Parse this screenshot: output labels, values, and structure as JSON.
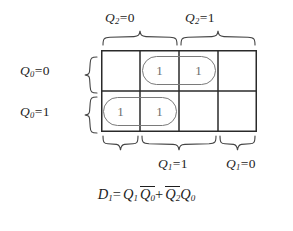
{
  "figure": {
    "name": "karnaugh-map-d1"
  },
  "colors": {
    "ink": "#1d1d1d",
    "grid_line": "#2a2a2a",
    "one_digit": "#6d6d6d",
    "group_outline": "#7a7a7a",
    "background": "#ffffff"
  },
  "column_labels": {
    "top_left": {
      "var": "Q",
      "sub": "2",
      "eq": "=",
      "value": "0",
      "spans_columns": [
        1,
        2
      ]
    },
    "top_right": {
      "var": "Q",
      "sub": "2",
      "eq": "=",
      "value": "1",
      "spans_columns": [
        3,
        4
      ]
    },
    "bottom_middle": {
      "var": "Q",
      "sub": "1",
      "eq": "=",
      "value": "1",
      "spans_columns": [
        2,
        3
      ]
    },
    "bottom_right": {
      "var": "Q",
      "sub": "1",
      "eq": "=",
      "value": "0",
      "spans_columns": [
        4
      ]
    },
    "bottom_left_unlabeled": {
      "label": "",
      "spans_columns": [
        1
      ]
    }
  },
  "row_labels": {
    "row_0": {
      "var": "Q",
      "sub": "0",
      "eq": "=",
      "value": "0"
    },
    "row_1": {
      "var": "Q",
      "sub": "0",
      "eq": "=",
      "value": "1"
    }
  },
  "grid": {
    "columns": 4,
    "rows": 2,
    "cell_width": 39,
    "cell_height": 41,
    "cells": [
      {
        "row": 0,
        "col": 0,
        "value": ""
      },
      {
        "row": 0,
        "col": 1,
        "value": "1"
      },
      {
        "row": 0,
        "col": 2,
        "value": "1"
      },
      {
        "row": 0,
        "col": 3,
        "value": ""
      },
      {
        "row": 1,
        "col": 0,
        "value": "1"
      },
      {
        "row": 1,
        "col": 1,
        "value": "1"
      },
      {
        "row": 1,
        "col": 2,
        "value": ""
      },
      {
        "row": 1,
        "col": 3,
        "value": ""
      }
    ]
  },
  "groups": [
    {
      "name": "group-top",
      "row": 0,
      "cols": [
        1,
        2
      ],
      "term": "Q2' Q0'"
    },
    {
      "name": "group-bottom",
      "row": 1,
      "cols": [
        0,
        1
      ],
      "term": "Q1 Q0'"
    }
  ],
  "equation": {
    "lhs_var": "D",
    "lhs_sub": "1",
    "eq": "=",
    "term1": {
      "a_var": "Q",
      "a_sub": "1",
      "b_var": "Q",
      "b_sub": "0",
      "b_overbar": true
    },
    "plus": "+",
    "term2": {
      "a_var": "Q",
      "a_sub": "2",
      "a_overbar": true,
      "b_var": "Q",
      "b_sub": "0"
    },
    "plain_text": "D1 = Q1 Q0' + Q2' Q0"
  }
}
